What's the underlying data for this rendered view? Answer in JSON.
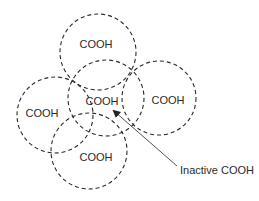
{
  "diagram": {
    "title": "",
    "circles": [
      {
        "id": "top",
        "cx": 98,
        "cy": 52,
        "r": 38,
        "label": "COOH",
        "tx": 96,
        "ty": 48
      },
      {
        "id": "center",
        "cx": 106,
        "cy": 98,
        "r": 38,
        "label": "COOH",
        "tx": 102,
        "ty": 105
      },
      {
        "id": "right",
        "cx": 159,
        "cy": 98,
        "r": 37,
        "label": "COOH",
        "tx": 168,
        "ty": 104
      },
      {
        "id": "left",
        "cx": 55,
        "cy": 115,
        "r": 38,
        "label": "COOH",
        "tx": 42,
        "ty": 117
      },
      {
        "id": "bottom",
        "cx": 89,
        "cy": 151,
        "r": 38,
        "label": "COOH",
        "tx": 96,
        "ty": 161
      }
    ],
    "annotation": {
      "label": "Inactive COOH",
      "x": 180,
      "y": 174,
      "arrow_from": [
        177,
        166
      ],
      "arrow_to": [
        113,
        110
      ]
    },
    "colors": {
      "stroke": "#2a2a2a",
      "text": "#2b2b2b",
      "arrow": "#555555"
    }
  }
}
